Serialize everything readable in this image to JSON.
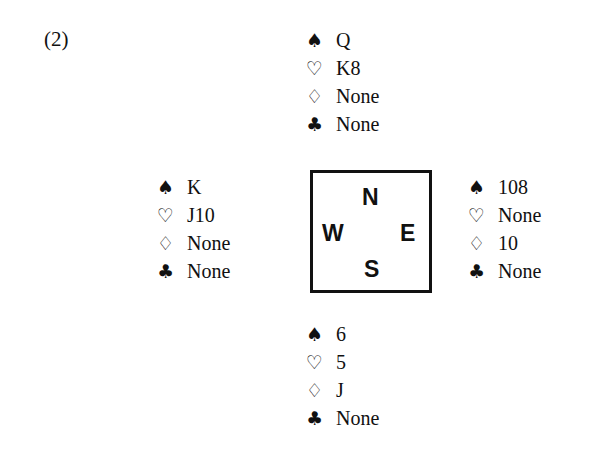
{
  "problem": {
    "label": "(2)"
  },
  "suit_symbols": {
    "spades": "♠",
    "hearts": "♡",
    "diamonds": "♢",
    "clubs": "♣"
  },
  "compass": {
    "north": "N",
    "west": "W",
    "east": "E",
    "south": "S"
  },
  "hands": {
    "north": {
      "spades": "Q",
      "hearts": "K8",
      "diamonds": "None",
      "clubs": "None"
    },
    "west": {
      "spades": "K",
      "hearts": "J10",
      "diamonds": "None",
      "clubs": "None"
    },
    "east": {
      "spades": "108",
      "hearts": "None",
      "diamonds": "10",
      "clubs": "None"
    },
    "south": {
      "spades": "6",
      "hearts": "5",
      "diamonds": "J",
      "clubs": "None"
    }
  }
}
